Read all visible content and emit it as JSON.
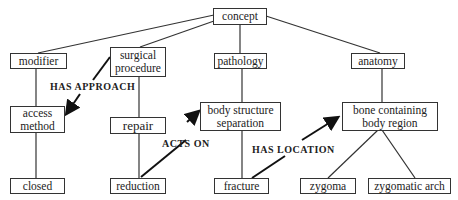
{
  "nodes": {
    "concept": "concept",
    "modifier": "modifier",
    "surgical_procedure": "surgical procedure",
    "pathology": "pathology",
    "anatomy": "anatomy",
    "access_method": "access method",
    "repair": "repair",
    "body_structure_separation": "body structure separation",
    "bone_containing_body_region": "bone containing body region",
    "closed": "closed",
    "reduction": "reduction",
    "fracture": "fracture",
    "zygoma": "zygoma",
    "zygomatic_arch": "zygomatic arch"
  },
  "relations": {
    "has_approach": "HAS APPROACH",
    "acts_on": "ACTS ON",
    "has_location": "HAS LOCATION"
  },
  "colors": {
    "line": "#333333",
    "text": "#222222",
    "background": "#ffffff"
  }
}
